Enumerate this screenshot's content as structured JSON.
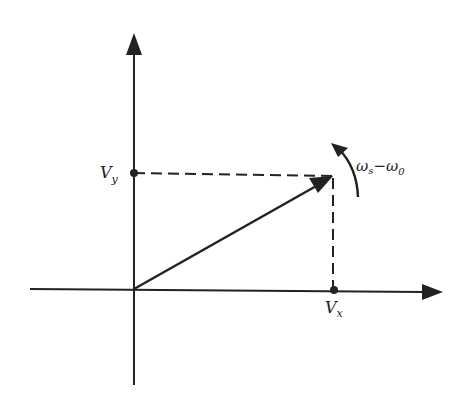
{
  "diagram": {
    "type": "phasor-vector",
    "labels": {
      "vy": "V",
      "vy_sub": "y",
      "vx": "V",
      "vx_sub": "x",
      "rotation": "ω",
      "rotation_sub1": "s",
      "rotation_minus": "−ω",
      "rotation_sub2": "0"
    },
    "colors": {
      "ink": "#222222",
      "background": "#ffffff"
    }
  }
}
